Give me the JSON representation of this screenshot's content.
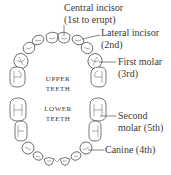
{
  "diagram": {
    "type": "dental-arch"
  },
  "labels": {
    "central_incisor": {
      "line1": "Central incisor",
      "line2": "(1st to erupt)"
    },
    "lateral_incisor": {
      "line1": "Lateral incisor",
      "line2": "(2nd)"
    },
    "first_molar": {
      "line1": "First molar",
      "line2": "(3rd)"
    },
    "second_molar": {
      "line1": "Second",
      "line2": "molar (5th)"
    },
    "canine": {
      "line1": "Canine (4th)"
    }
  },
  "jaws": {
    "upper": {
      "line1": "Upper",
      "line2": "teeth"
    },
    "lower": {
      "line1": "Lower",
      "line2": "teeth"
    }
  },
  "colors": {
    "stroke": "#555555",
    "text": "#3a3a3a",
    "background": "#ffffff"
  }
}
